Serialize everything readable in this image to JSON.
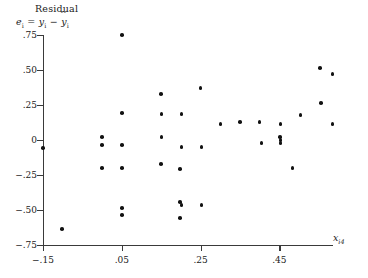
{
  "chart_data": {
    "type": "scatter",
    "title": "",
    "ylabel": "Residual",
    "ylabel_formula": "e_i = y_i - yhat_i",
    "xlabel": "x_i4",
    "xlim": [
      -0.15,
      0.585
    ],
    "ylim": [
      -0.75,
      0.8
    ],
    "grid": false,
    "legend": null,
    "xticks": [
      -0.15,
      0.05,
      0.25,
      0.45
    ],
    "xticklabels": [
      "−.15",
      ".05",
      ".25",
      ".45"
    ],
    "yticks": [
      0.75,
      0.5,
      0.25,
      0,
      -0.25,
      -0.5,
      -0.75
    ],
    "yticklabels": [
      ".75",
      ".50",
      ".25",
      "0",
      "−.25",
      "−.50",
      "−.75"
    ],
    "marker": "filled-circle",
    "marker_color": "#121212",
    "points": [
      {
        "x": -0.15,
        "y": -0.057
      },
      {
        "x": -0.102,
        "y": -0.636
      },
      {
        "x": 0.05,
        "y": 0.75
      },
      {
        "x": 0.05,
        "y": 0.193
      },
      {
        "x": 0.05,
        "y": -0.036
      },
      {
        "x": 0.05,
        "y": -0.2
      },
      {
        "x": 0.05,
        "y": -0.486
      },
      {
        "x": 0.05,
        "y": -0.536
      },
      {
        "x": 0.0,
        "y": 0.021
      },
      {
        "x": 0.0,
        "y": -0.036
      },
      {
        "x": 0.0,
        "y": -0.2
      },
      {
        "x": 0.151,
        "y": 0.186
      },
      {
        "x": 0.151,
        "y": 0.021
      },
      {
        "x": 0.202,
        "y": 0.186
      },
      {
        "x": 0.202,
        "y": -0.05
      },
      {
        "x": 0.201,
        "y": -0.464
      },
      {
        "x": 0.252,
        "y": -0.05
      },
      {
        "x": 0.252,
        "y": -0.464
      },
      {
        "x": 0.15,
        "y": 0.329
      },
      {
        "x": 0.15,
        "y": -0.171
      },
      {
        "x": 0.198,
        "y": -0.207
      },
      {
        "x": 0.198,
        "y": -0.443
      },
      {
        "x": 0.198,
        "y": -0.557
      },
      {
        "x": 0.25,
        "y": 0.371
      },
      {
        "x": 0.3,
        "y": 0.114
      },
      {
        "x": 0.35,
        "y": 0.129
      },
      {
        "x": 0.4,
        "y": 0.129
      },
      {
        "x": 0.404,
        "y": -0.021
      },
      {
        "x": 0.452,
        "y": 0.021
      },
      {
        "x": 0.453,
        "y": 0.0
      },
      {
        "x": 0.453,
        "y": -0.021
      },
      {
        "x": 0.453,
        "y": 0.114
      },
      {
        "x": 0.503,
        "y": 0.179
      },
      {
        "x": 0.553,
        "y": 0.514
      },
      {
        "x": 0.556,
        "y": 0.264
      },
      {
        "x": 0.585,
        "y": 0.471
      },
      {
        "x": 0.585,
        "y": 0.114
      },
      {
        "x": 0.483,
        "y": -0.2
      }
    ]
  },
  "labels": {
    "y_title_line1": "Residual",
    "y_title_e": "e",
    "y_title_sub_i": "i",
    "y_title_eq": "=",
    "y_title_y": "y",
    "y_title_minus": "−",
    "y_title_yhat": "y",
    "x_title_x": "x",
    "x_title_sub": "i4"
  }
}
